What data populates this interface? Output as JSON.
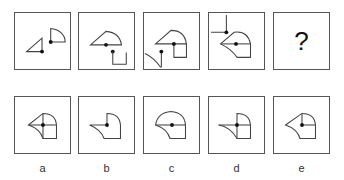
{
  "puzzle": {
    "sequence": [
      {
        "id": "panel-1",
        "content": "shapes"
      },
      {
        "id": "panel-2",
        "content": "shapes"
      },
      {
        "id": "panel-3",
        "content": "shapes"
      },
      {
        "id": "panel-4",
        "content": "shapes"
      },
      {
        "id": "panel-5",
        "content": "question",
        "text": "?"
      }
    ],
    "options": [
      {
        "label": "a"
      },
      {
        "label": "b"
      },
      {
        "label": "c"
      },
      {
        "label": "d"
      },
      {
        "label": "e"
      }
    ]
  }
}
